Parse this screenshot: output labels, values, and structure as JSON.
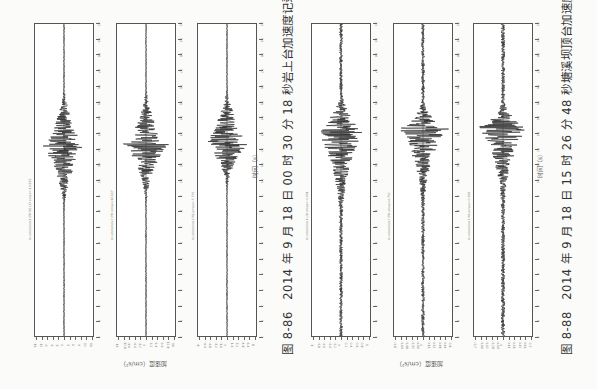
{
  "figures": [
    {
      "id": "fig-8-86",
      "caption": "图 8-86　2014 年 9 月 18 日 00 时 30 分 18 秒岩上台加速度记录",
      "amplitude_axis_label": "加速度（cm/s²）",
      "time_axis_label": "时间（s）",
      "panels": [
        {
          "record_label": "Acceleration  1 EW  NS  UD  amax=-13.835",
          "amp_ticks": [
            "-15",
            "-12",
            "-9",
            "-6",
            "-3",
            "0",
            "3",
            "6",
            "9",
            "12",
            "15"
          ]
        },
        {
          "record_label": "Acceleration  2 EW  amax=14.637",
          "amp_ticks": [
            "-16",
            "-12.8",
            "-9.6",
            "-6.4",
            "-3.2",
            "0",
            "3.2",
            "6.4",
            "9.6",
            "12.8",
            "16"
          ]
        },
        {
          "record_label": "Acceleration  3 NS  amax=-7.770",
          "amp_ticks": [
            "-8",
            "-6.4",
            "-4.8",
            "-3.2",
            "-1.6",
            "0",
            "1.6",
            "3.2",
            "4.8",
            "6.4",
            "8"
          ]
        }
      ]
    },
    {
      "id": "fig-8-88",
      "caption": "图 8-88　2014 年 9 月 18 日 15 时 26 分 48 秒塘溪坝顶台加速度记录",
      "amplitude_axis_label": "加速度（cm/s²）",
      "time_axis_label": "时间（s）",
      "panels": [
        {
          "record_label": "Acceleration  1 UD  amax=-0.941",
          "amp_ticks": [
            "-1",
            "-0.8",
            "-0.6",
            "-0.4",
            "-0.2",
            "0",
            "0.2",
            "0.4",
            "0.6",
            "0.8",
            "1"
          ]
        },
        {
          "record_label": "Acceleration  2 EW  amax=0.752",
          "amp_ticks": [
            "-0.8",
            "-0.64",
            "-0.48",
            "-0.32",
            "-0.16",
            "0",
            "0.16",
            "0.32",
            "0.48",
            "0.64",
            "0.8"
          ]
        },
        {
          "record_label": "Acceleration  3 NS  amax=-0.658",
          "amp_ticks": [
            "-0.7",
            "-0.56",
            "-0.42",
            "-0.28",
            "-0.14",
            "0",
            "0.14",
            "0.28",
            "0.42",
            "0.56",
            "0.7"
          ]
        }
      ]
    }
  ],
  "time_ticks": [
    "0",
    "1",
    "2",
    "3",
    "4",
    "5",
    "6",
    "7",
    "8",
    "9",
    "10",
    "11",
    "12",
    "13",
    "14",
    "15",
    "16",
    "17",
    "18",
    "19",
    "20"
  ],
  "chart_data": [
    {
      "type": "line",
      "title": "岩上台 record 1",
      "xlabel": "时间（s）",
      "ylabel": "加速度（cm/s²）",
      "xlim": [
        0,
        20
      ],
      "ylim": [
        -15,
        15
      ],
      "envelope": {
        "onset_s": 7.5,
        "peak_s": 12.2,
        "peak_amp": -13.8,
        "decay_end_s": 16,
        "noise": 0.3
      }
    },
    {
      "type": "line",
      "title": "岩上台 record 2",
      "xlabel": "时间（s）",
      "ylabel": "加速度（cm/s²）",
      "xlim": [
        0,
        20
      ],
      "ylim": [
        -16,
        16
      ],
      "envelope": {
        "onset_s": 8,
        "peak_s": 12.3,
        "peak_amp": 14.6,
        "decay_end_s": 16,
        "noise": 0.3
      }
    },
    {
      "type": "line",
      "title": "岩上台 record 3",
      "xlabel": "时间（s）",
      "ylabel": "加速度（cm/s²）",
      "xlim": [
        0,
        20
      ],
      "ylim": [
        -8,
        8
      ],
      "envelope": {
        "onset_s": 9,
        "peak_s": 12.5,
        "peak_amp": -7.8,
        "decay_end_s": 16,
        "noise": 0.15
      }
    },
    {
      "type": "line",
      "title": "塘溪坝顶台 record 1",
      "xlabel": "时间（s）",
      "ylabel": "加速度（cm/s²）",
      "xlim": [
        0,
        20
      ],
      "ylim": [
        -1,
        1
      ],
      "envelope": {
        "onset_s": 7,
        "peak_s": 13.2,
        "peak_amp": -0.94,
        "decay_end_s": 15.5,
        "noise": 0.06
      }
    },
    {
      "type": "line",
      "title": "塘溪坝顶台 record 2",
      "xlabel": "时间（s）",
      "ylabel": "加速度（cm/s²）",
      "xlim": [
        0,
        20
      ],
      "ylim": [
        -0.8,
        0.8
      ],
      "envelope": {
        "onset_s": 8,
        "peak_s": 13.3,
        "peak_amp": 0.75,
        "decay_end_s": 15,
        "noise": 0.05
      }
    },
    {
      "type": "line",
      "title": "塘溪坝顶台 record 3",
      "xlabel": "时间（s）",
      "ylabel": "加速度（cm/s²）",
      "xlim": [
        0,
        20
      ],
      "ylim": [
        -0.7,
        0.7
      ],
      "envelope": {
        "onset_s": 8,
        "peak_s": 13.4,
        "peak_amp": -0.66,
        "decay_end_s": 15,
        "noise": 0.05
      }
    }
  ]
}
